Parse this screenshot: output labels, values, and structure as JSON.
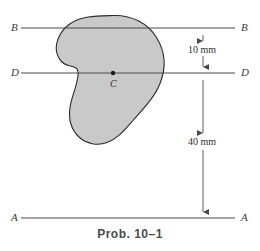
{
  "figure": {
    "caption": "Prob. 10–1",
    "centroid_label": "C",
    "axes": [
      {
        "id": "B",
        "left_label": "B",
        "right_label": "B",
        "y": 28
      },
      {
        "id": "D",
        "left_label": "D",
        "right_label": "D",
        "y": 73
      },
      {
        "id": "A",
        "left_label": "A",
        "right_label": "A",
        "y": 218
      }
    ],
    "dimensions": [
      {
        "id": "B-to-D",
        "text": "10 mm",
        "from_y": 28,
        "to_y": 73
      },
      {
        "id": "D-to-A",
        "text": "40 mm",
        "from_y": 73,
        "to_y": 218
      }
    ],
    "colors": {
      "shape_fill": "#c9c9c9",
      "shape_stroke": "#2b2b2b",
      "line": "#4a4a4a",
      "text": "#2e2e2e",
      "caption": "#4a4a4a",
      "background": "#ffffff"
    },
    "shape": {
      "name": "cross-section-area",
      "path": "M 113.5 15.5 C 132 15.0 148 23.5 156.5 37.5 C 165.5 52.0 166.0 68.5 160.0 83.5 C 154.5 97.5 143.0 109.0 133.0 120.5 C 125.5 129.0 118.0 138.5 107.0 142.5 C 97.5 146.0 86.5 144.0 79.0 137.0 C 71.0 129.5 68.5 118.0 70.0 107.5 C 71.5 96.5 77.0 86.5 78.0 75.5 C 78.8 66.5 74.0 66.8 68.5 65.5 C 62.0 64.0 57.5 58.0 56.5 51.5 C 55.0 41.5 60.5 31.0 69.0 24.5 C 81.0 15.5 98.0 15.9 113.5 15.5 Z"
    },
    "centroid": {
      "x": 113,
      "y": 73
    },
    "dim_line_x": 203,
    "label_positions": {
      "left_label_x": 11,
      "right_label_x": 241,
      "dim_text_x": 208,
      "dim_10mm_y": 45,
      "dim_40mm_y": 141,
      "centroid_label_x": 110,
      "centroid_label_y": 79
    }
  }
}
